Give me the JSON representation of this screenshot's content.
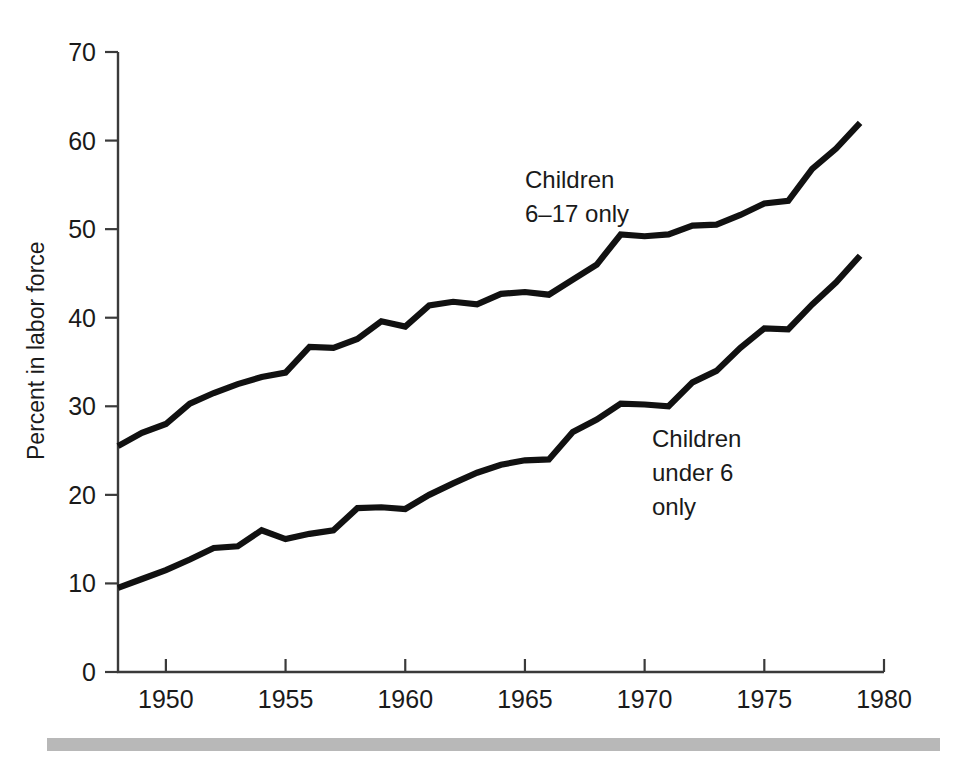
{
  "figure": {
    "background_color": "#ffffff",
    "line_color": "#111111",
    "axis_color": "#3a3a3a",
    "footer_rule_color": "#b8b8b8"
  },
  "axes": {
    "y_title": "Percent in labor force",
    "y_ticks": [
      "70",
      "60",
      "50",
      "40",
      "30",
      "20",
      "10",
      "0"
    ],
    "x_ticks": [
      "1950",
      "1955",
      "1960",
      "1965",
      "1970",
      "1975",
      "1980"
    ]
  },
  "annotations": {
    "upper": {
      "line1": "Children",
      "line2": "6–17 only"
    },
    "lower": {
      "line1": "Children",
      "line2": "under 6",
      "line3": "only"
    }
  },
  "chart_data": {
    "type": "line",
    "title": "",
    "xlabel": "",
    "ylabel": "Percent in labor force",
    "xlim": [
      1948,
      1980
    ],
    "ylim": [
      0,
      70
    ],
    "xticks": [
      1950,
      1955,
      1960,
      1965,
      1970,
      1975,
      1980
    ],
    "yticks": [
      0,
      10,
      20,
      30,
      40,
      50,
      60,
      70
    ],
    "grid": false,
    "legend": "inline annotations",
    "x": [
      1948,
      1949,
      1950,
      1951,
      1952,
      1953,
      1954,
      1955,
      1956,
      1957,
      1958,
      1959,
      1960,
      1961,
      1962,
      1963,
      1964,
      1965,
      1966,
      1967,
      1968,
      1969,
      1970,
      1971,
      1972,
      1973,
      1974,
      1975,
      1976,
      1977,
      1978,
      1979
    ],
    "series": [
      {
        "name": "Children 6-17 only",
        "label_line1": "Children",
        "label_line2": "6-17 only",
        "values": [
          25.5,
          27.0,
          28.0,
          30.3,
          31.5,
          32.5,
          33.3,
          33.8,
          36.7,
          36.6,
          37.6,
          39.6,
          39.0,
          41.4,
          41.8,
          41.5,
          42.7,
          42.9,
          42.6,
          44.3,
          46.0,
          49.4,
          49.2,
          49.4,
          50.4,
          50.5,
          51.6,
          52.9,
          53.2,
          56.8,
          59.1,
          62.0
        ]
      },
      {
        "name": "Children under 6 only",
        "label_line1": "Children",
        "label_line2": "under 6",
        "label_line3": "only",
        "values": [
          9.5,
          10.5,
          11.5,
          12.7,
          14.0,
          14.2,
          16.0,
          15.0,
          15.6,
          16.0,
          18.5,
          18.6,
          18.4,
          20.0,
          21.3,
          22.5,
          23.4,
          23.9,
          24.0,
          27.1,
          28.5,
          30.3,
          30.2,
          30.0,
          32.7,
          34.0,
          36.6,
          38.8,
          38.7,
          41.5,
          44.0,
          47.0
        ]
      }
    ]
  }
}
